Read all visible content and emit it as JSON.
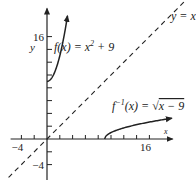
{
  "chart_data": {
    "type": "line",
    "title": "",
    "xlabel": "x",
    "ylabel": "y",
    "xlim": [
      -6,
      19
    ],
    "ylim": [
      -6,
      21
    ],
    "x_tick_step": 2,
    "y_tick_step": 2,
    "x_tick_labels": [
      {
        "value": -4,
        "text": "−4"
      },
      {
        "value": 16,
        "text": "16"
      }
    ],
    "y_tick_labels": [
      {
        "value": 16,
        "text": "16"
      },
      {
        "value": -4,
        "text": "−4"
      }
    ],
    "grid": false,
    "series": [
      {
        "name": "f(x) = x² + 9",
        "label_main": "f(x) = x",
        "label_sup": "2",
        "label_tail": " + 9",
        "style": "solid",
        "domain": [
          0,
          3.2
        ],
        "formula": "x^2 + 9",
        "arrow_end": true
      },
      {
        "name": "f⁻¹(x) = √(x − 9)",
        "label_main": "f",
        "label_sup": "−1",
        "label_tail": "(x) = √",
        "label_radicand": "x − 9",
        "style": "solid",
        "domain": [
          9,
          19.5
        ],
        "formula": "sqrt(x - 9)",
        "arrow_end": true
      },
      {
        "name": "y = x",
        "label_main": "y = x",
        "style": "dashed",
        "domain": [
          -8,
          24
        ],
        "formula": "x"
      }
    ]
  }
}
